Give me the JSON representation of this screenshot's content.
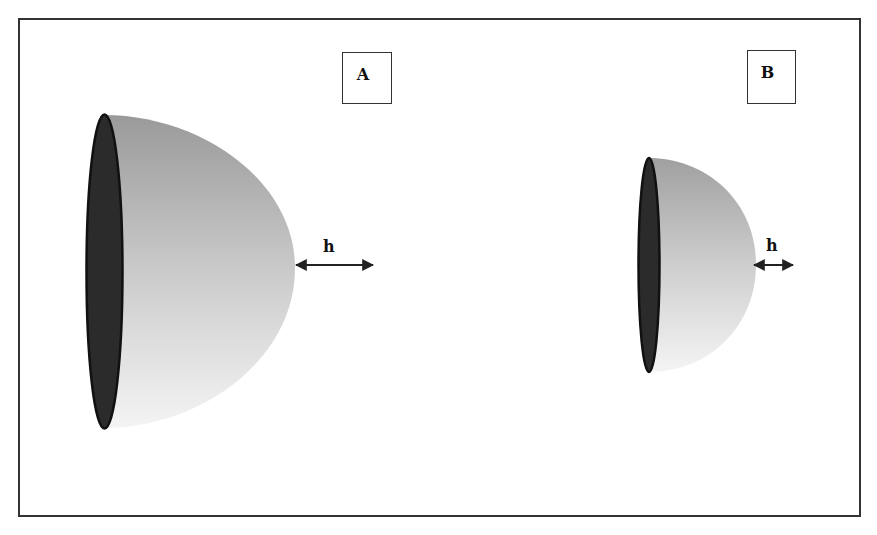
{
  "figure": {
    "panels": [
      {
        "id": "A",
        "label": "A",
        "shape": "hemisphere",
        "size": "large",
        "dimension_label": "h"
      },
      {
        "id": "B",
        "label": "B",
        "shape": "hemisphere",
        "size": "small",
        "dimension_label": "h"
      }
    ],
    "colors": {
      "frame": "#333333",
      "base_ellipse": "#2b2b2b",
      "dome_dark": "#9a9a9a",
      "dome_light": "#f2f2f2",
      "arrow": "#222222"
    }
  }
}
